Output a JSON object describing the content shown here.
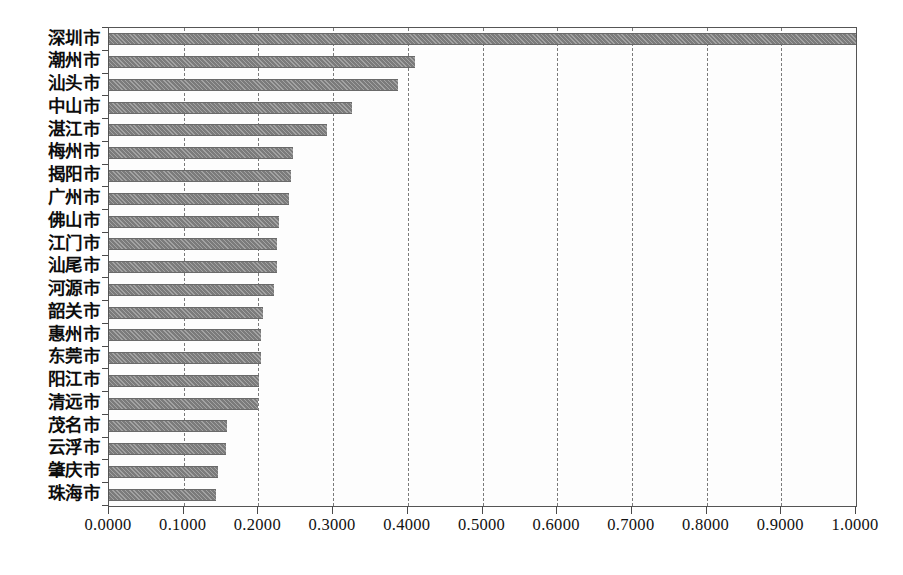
{
  "chart_data": {
    "type": "bar",
    "orientation": "horizontal",
    "title": "",
    "subtitle": "",
    "xlabel": "",
    "ylabel": "",
    "xlim": [
      0.0,
      1.0
    ],
    "grid": true,
    "legend": null,
    "series_color": "#7b7b7b",
    "categories": [
      "深圳市",
      "潮州市",
      "汕头市",
      "中山市",
      "湛江市",
      "梅州市",
      "揭阳市",
      "广州市",
      "佛山市",
      "江门市",
      "汕尾市",
      "河源市",
      "韶关市",
      "惠州市",
      "东莞市",
      "阳江市",
      "清远市",
      "茂名市",
      "云浮市",
      "肇庆市",
      "珠海市"
    ],
    "values": [
      1.0,
      0.41,
      0.387,
      0.325,
      0.292,
      0.246,
      0.244,
      0.241,
      0.228,
      0.225,
      0.225,
      0.221,
      0.206,
      0.203,
      0.203,
      0.201,
      0.199,
      0.158,
      0.157,
      0.146,
      0.143
    ],
    "xticks": [
      0.0,
      0.1,
      0.2,
      0.3,
      0.4,
      0.5,
      0.6,
      0.7,
      0.8,
      0.9,
      1.0
    ],
    "xticklabels": [
      "0.0000",
      "0.1000",
      "0.2000",
      "0.3000",
      "0.4000",
      "0.5000",
      "0.6000",
      "0.7000",
      "0.8000",
      "0.9000",
      "1.0000"
    ]
  }
}
